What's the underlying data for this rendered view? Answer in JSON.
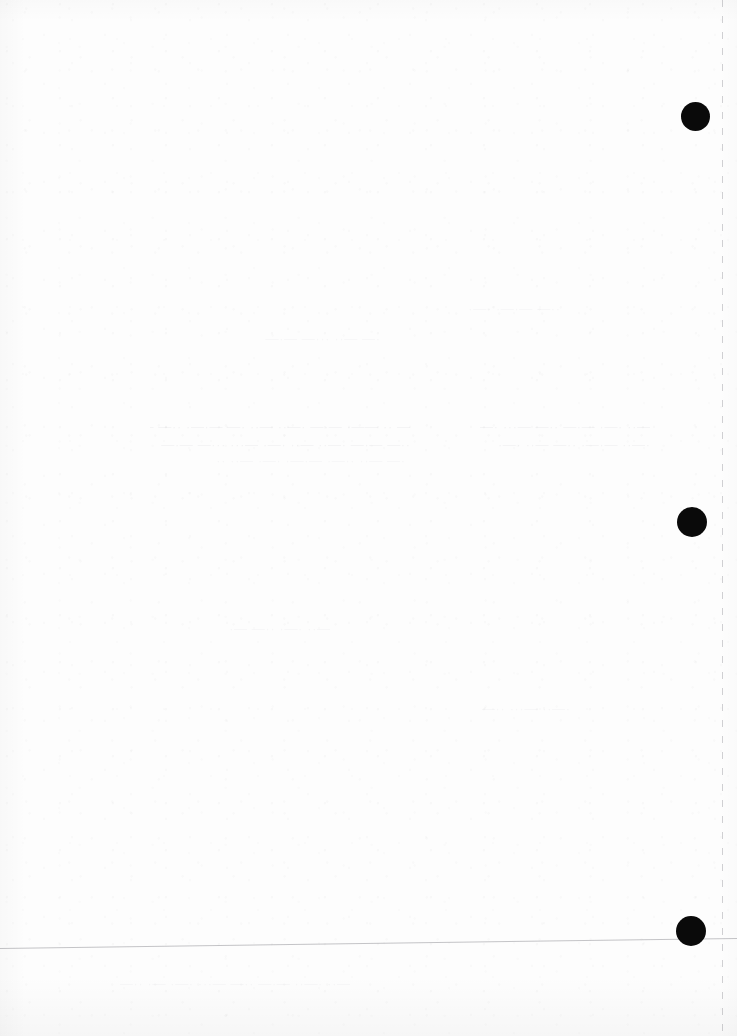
{
  "document": {
    "type": "scanned-page",
    "description": "Blank scanned document page with binder hole marks",
    "width": 737,
    "height": 1036,
    "background_color": "#fdfdfd",
    "visible_text": ""
  },
  "marks": {
    "hole_color": "#0a0a0a",
    "holes": [
      {
        "name": "hole-mark-top",
        "cx": 695,
        "cy": 116,
        "d": 29
      },
      {
        "name": "hole-mark-middle",
        "cx": 692,
        "cy": 522,
        "d": 30
      },
      {
        "name": "hole-mark-bottom",
        "cx": 691,
        "cy": 931,
        "d": 30
      }
    ]
  },
  "guides": {
    "dashed_vertical": {
      "name": "dashed-vertical-guide",
      "x": 722,
      "color": "#787880",
      "dash_length": 7,
      "gap_length": 9
    },
    "bottom_rule": {
      "name": "bottom-horizontal-rule",
      "x_start": 0,
      "y_start": 948,
      "x_end": 737,
      "y_end": 938,
      "color": "#6e6e76"
    }
  },
  "bleed_through": {
    "note": "Illegible show-through text from the reverse side of the sheet",
    "lines": [
      {
        "x": 150,
        "y": 418,
        "text": "— ·· ——· —·— ·—·· —·· ·— —·—· ··— —··· ·—· —··—"
      },
      {
        "x": 160,
        "y": 436,
        "text": "··— —·— ·—·· —·· ·—· —··· ···— —·—· ·—·· —·"
      },
      {
        "x": 205,
        "y": 452,
        "text": "·— —·· ··—· —·—· ·—· —·· ··"
      },
      {
        "x": 470,
        "y": 418,
        "text": "—·· ·—· —·— ··— —··· ·—"
      },
      {
        "x": 480,
        "y": 436,
        "text": "·—·· —·—· ··— —·· ·—·"
      },
      {
        "x": 120,
        "y": 975,
        "text": "—·· ·—·· —·— ··— —··· ·—· —· ··—·"
      },
      {
        "x": 230,
        "y": 330,
        "text": "·— —·· ···— —·—"
      },
      {
        "x": 420,
        "y": 300,
        "text": "··— —·—· ·—·"
      },
      {
        "x": 180,
        "y": 620,
        "text": "—·· ·—· ··— —·"
      },
      {
        "x": 430,
        "y": 700,
        "text": "·—·· —··· ··—"
      }
    ]
  }
}
